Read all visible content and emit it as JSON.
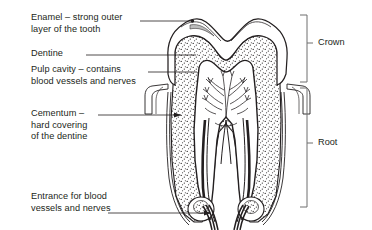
{
  "figure": {
    "background_color": "#ffffff",
    "line_color": "#231f20",
    "text_color": "#231f20",
    "dentine_fill": "#ffffff",
    "dentine_stipple_color": "#231f20"
  },
  "labels": {
    "enamel": "Enamel – strong outer\nlayer of the tooth",
    "dentine": "Dentine",
    "pulp": "Pulp cavity – contains\nblood vessels and nerves",
    "cementum": "Cementum –\nhard covering\nof the dentine",
    "entrance": "Entrance for blood\nvessels and nerves"
  },
  "regions": {
    "crown": "Crown",
    "root": "Root"
  },
  "parts": [
    {
      "name": "enamel",
      "label": "Enamel – strong outer layer of the tooth"
    },
    {
      "name": "dentine",
      "label": "Dentine"
    },
    {
      "name": "pulp-cavity",
      "label": "Pulp cavity – contains blood vessels and nerves"
    },
    {
      "name": "cementum",
      "label": "Cementum – hard covering of the dentine"
    },
    {
      "name": "entrance",
      "label": "Entrance for blood vessels and nerves"
    },
    {
      "name": "crown",
      "label": "Crown"
    },
    {
      "name": "root",
      "label": "Root"
    }
  ]
}
